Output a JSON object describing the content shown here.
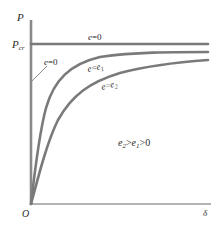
{
  "diagram": {
    "axes": {
      "y_label": "P",
      "x_label": "δ",
      "origin_label": "O",
      "pcr_label_main": "P",
      "pcr_label_sub": "cr"
    },
    "curves": [
      {
        "id": "ideal",
        "label_var": "e",
        "label_eq": "=",
        "label_val": "0",
        "description": "horizontal line at P_cr"
      },
      {
        "id": "ideal-vertical",
        "label_var": "e",
        "label_eq": "=",
        "label_val": "0",
        "description": "vertical segment along P axis up to P_cr"
      },
      {
        "id": "e1",
        "label_var": "e",
        "label_eq": "=",
        "label_val_main": "e",
        "label_val_sub": "1"
      },
      {
        "id": "e2",
        "label_var": "e",
        "label_eq": "=",
        "label_val_main": "e",
        "label_val_sub": "2"
      }
    ],
    "condition": {
      "e2_main": "e",
      "e2_sub": "2",
      "gt1": ">",
      "e1_main": "e",
      "e1_sub": "1",
      "gt2": ">",
      "zero": "0"
    },
    "colors": {
      "curve": "#7a7a7a",
      "axis": "#8a8a8a",
      "text": "#2a2a2a",
      "background": "#ffffff"
    }
  }
}
